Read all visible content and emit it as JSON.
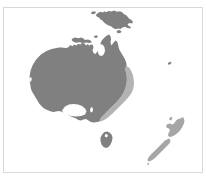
{
  "figure": {
    "name": "oceania-region-map",
    "caption": "",
    "background_color": "#ffffff",
    "frame_color": "#d9d9d9"
  },
  "map": {
    "title": "Oceania",
    "projection_note": "",
    "land_color": "#808080",
    "highlight_color": "#b3b3b3",
    "outline_color": "#808080",
    "regions": [
      {
        "name": "Australia",
        "label": "Australia",
        "fill": "#808080"
      },
      {
        "name": "East Coast Highlight",
        "label": "Eastern Australia",
        "fill": "#b3b3b3"
      },
      {
        "name": "Tasmania",
        "label": "Tasmania",
        "fill": "#808080"
      },
      {
        "name": "Papua New Guinea",
        "label": "Papua New Guinea",
        "fill": "#808080"
      },
      {
        "name": "New Zealand North Island",
        "label": "North Island",
        "fill": "#a6a6a6"
      },
      {
        "name": "New Zealand South Island",
        "label": "South Island",
        "fill": "#a6a6a6"
      }
    ]
  }
}
